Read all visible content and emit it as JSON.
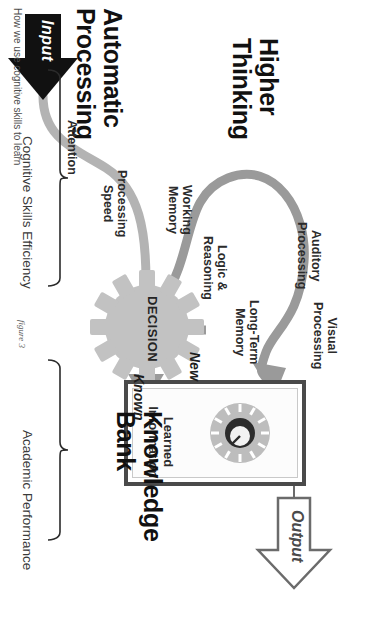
{
  "caption": "How we use cognitive skills to learn",
  "figure_label": "figure 3",
  "headings": {
    "automatic_processing": "Automatic\nProcessing",
    "higher_thinking": "Higher\nThinking",
    "knowledge_bank": "Knowledge\nBank"
  },
  "flow": {
    "input_label": "Input",
    "output_label": "Output",
    "decision_label": "DECISION",
    "new_label": "New",
    "known_label": "Known"
  },
  "skills": {
    "attention": "Attention",
    "processing_speed": "Processing\nSpeed",
    "working_memory": "Working\nMemory",
    "logic_reasoning": "Logic &\nReasoning",
    "long_term_memory": "Long-Term\nMemory",
    "auditory_processing": "Auditory\nProcessing",
    "visual_processing": "Visual\nProcessing"
  },
  "knowledge_bank": {
    "contents_label": "Learned\nInformation",
    "dial_icon": "combination-lock-dial-icon"
  },
  "brackets": {
    "cognitive_skills_efficiency": "Cognitive Skills Efficiency",
    "academic_performance": "Academic Performance"
  },
  "colors": {
    "path_light_grey": "#b3b3b3",
    "path_mid_grey": "#9a9a9a",
    "gear_grey": "#c2c2c2",
    "box_border": "#4a4a4a",
    "ink": "#111111",
    "outline_grey": "#6b6b6b"
  }
}
